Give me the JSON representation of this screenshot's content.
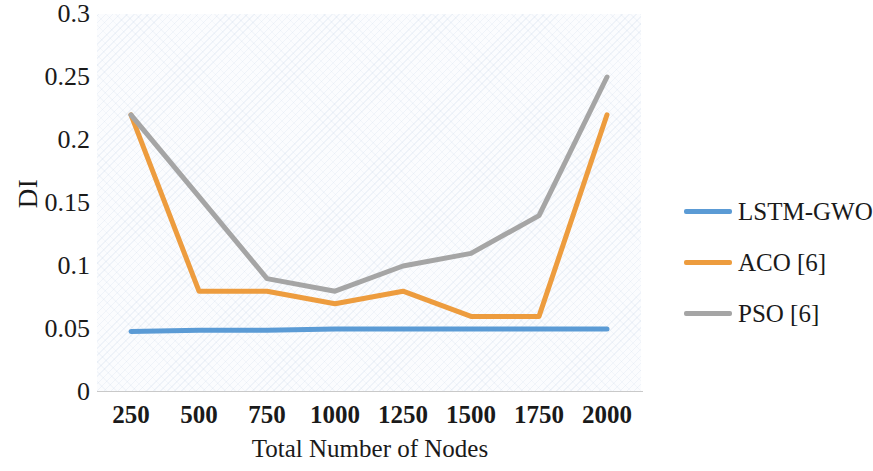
{
  "chart_data": {
    "type": "line",
    "title": "",
    "xlabel": "Total Number of Nodes",
    "ylabel": "DI",
    "categories": [
      "250",
      "500",
      "750",
      "1000",
      "1250",
      "1500",
      "1750",
      "2000"
    ],
    "x": [
      250,
      500,
      750,
      1000,
      1250,
      1500,
      1750,
      2000
    ],
    "xtick_labels": [
      "250",
      "500",
      "750",
      "1000",
      "1250",
      "1500",
      "1750",
      "2000"
    ],
    "ytick_labels": [
      "0",
      "0.05",
      "0.1",
      "0.15",
      "0.2",
      "0.25",
      "0.3"
    ],
    "yticks": [
      0,
      0.05,
      0.1,
      0.15,
      0.2,
      0.25,
      0.3
    ],
    "ylim": [
      0,
      0.3
    ],
    "grid": false,
    "legend_position": "right",
    "series": [
      {
        "name": "LSTM-GWO",
        "color": "#5B9BD5",
        "values": [
          0.048,
          0.049,
          0.049,
          0.05,
          0.05,
          0.05,
          0.05,
          0.05
        ]
      },
      {
        "name": "ACO [6]",
        "color": "#ED9C3E",
        "values": [
          0.22,
          0.08,
          0.08,
          0.07,
          0.08,
          0.06,
          0.06,
          0.22
        ]
      },
      {
        "name": "PSO [6]",
        "color": "#A5A5A5",
        "values": [
          0.22,
          0.155,
          0.09,
          0.08,
          0.1,
          0.11,
          0.14,
          0.25
        ]
      }
    ]
  },
  "legend": {
    "items": [
      {
        "label": "LSTM-GWO",
        "color": "#5B9BD5"
      },
      {
        "label": "ACO [6]",
        "color": "#ED9C3E"
      },
      {
        "label": "PSO [6]",
        "color": "#A5A5A5"
      }
    ]
  }
}
